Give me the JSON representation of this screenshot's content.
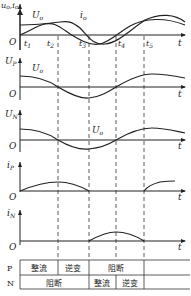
{
  "panels": [
    {
      "id": "top",
      "ylabel": "u_o, i_o",
      "ylabel_text": "u, i",
      "sub": "o",
      "curve_labels": [
        {
          "text": "U",
          "sub": "o"
        },
        {
          "text": "i",
          "sub": "o"
        }
      ]
    },
    {
      "id": "up",
      "ylabel": "U",
      "ylabel_sub": "P",
      "curve_label": {
        "text": "U",
        "sub": "o"
      }
    },
    {
      "id": "un",
      "ylabel": "U",
      "ylabel_sub": "N",
      "curve_label": {
        "text": "U",
        "sub": "o"
      }
    },
    {
      "id": "ip",
      "ylabel": "i",
      "ylabel_sub": "P"
    },
    {
      "id": "in",
      "ylabel": "i",
      "ylabel_sub": "N"
    }
  ],
  "axis": {
    "origin": "O",
    "x": "t"
  },
  "time_marks": [
    {
      "text": "t",
      "sub": "1"
    },
    {
      "text": "t",
      "sub": "2"
    },
    {
      "text": "t",
      "sub": "3"
    },
    {
      "text": "t",
      "sub": "4"
    },
    {
      "text": "t",
      "sub": "5"
    }
  ],
  "table": {
    "rows": [
      {
        "label": "P",
        "cells": [
          "整流",
          "逆变",
          "阻断",
          ""
        ]
      },
      {
        "label": "N",
        "cells": [
          "阻断",
          "整流",
          "逆变",
          ""
        ]
      }
    ]
  }
}
